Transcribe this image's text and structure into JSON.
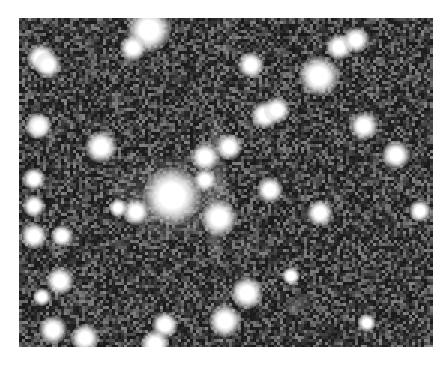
{
  "image": {
    "type": "astronomical-field",
    "background_color": "#2a2a2a",
    "frame": {
      "x": 19,
      "y": 18,
      "width": 414,
      "height": 329
    },
    "diffuse": [
      {
        "x": 155,
        "y": 180,
        "rx": 60,
        "ry": 40,
        "alpha": 0.28
      },
      {
        "x": 197,
        "y": 120,
        "rx": 8,
        "ry": 20,
        "alpha": 0.35
      },
      {
        "x": 199,
        "y": 160,
        "rx": 9,
        "ry": 30,
        "alpha": 0.35
      },
      {
        "x": 196,
        "y": 215,
        "rx": 9,
        "ry": 35,
        "alpha": 0.35
      },
      {
        "x": 205,
        "y": 300,
        "rx": 10,
        "ry": 25,
        "alpha": 0.25
      }
    ],
    "stars": [
      {
        "x": 130,
        "y": 12,
        "r": 12
      },
      {
        "x": 114,
        "y": 30,
        "r": 7
      },
      {
        "x": 22,
        "y": 40,
        "r": 8
      },
      {
        "x": 29,
        "y": 47,
        "r": 7
      },
      {
        "x": 232,
        "y": 47,
        "r": 7
      },
      {
        "x": 300,
        "y": 58,
        "r": 11
      },
      {
        "x": 320,
        "y": 29,
        "r": 7
      },
      {
        "x": 337,
        "y": 22,
        "r": 7
      },
      {
        "x": 246,
        "y": 97,
        "r": 8
      },
      {
        "x": 258,
        "y": 92,
        "r": 7
      },
      {
        "x": 19,
        "y": 108,
        "r": 7
      },
      {
        "x": 20,
        "y": 108,
        "r": 6
      },
      {
        "x": 82,
        "y": 129,
        "r": 9
      },
      {
        "x": 345,
        "y": 108,
        "r": 8
      },
      {
        "x": 377,
        "y": 137,
        "r": 8
      },
      {
        "x": 186,
        "y": 139,
        "r": 8
      },
      {
        "x": 210,
        "y": 129,
        "r": 7
      },
      {
        "x": 186,
        "y": 162,
        "r": 6
      },
      {
        "x": 153,
        "y": 178,
        "r": 16
      },
      {
        "x": 117,
        "y": 194,
        "r": 7
      },
      {
        "x": 99,
        "y": 190,
        "r": 5
      },
      {
        "x": 200,
        "y": 200,
        "r": 10
      },
      {
        "x": 251,
        "y": 172,
        "r": 7
      },
      {
        "x": 301,
        "y": 195,
        "r": 7
      },
      {
        "x": 401,
        "y": 193,
        "r": 6
      },
      {
        "x": 15,
        "y": 161,
        "r": 6
      },
      {
        "x": 15,
        "y": 188,
        "r": 6
      },
      {
        "x": 15,
        "y": 218,
        "r": 7
      },
      {
        "x": 43,
        "y": 218,
        "r": 6
      },
      {
        "x": 41,
        "y": 263,
        "r": 8
      },
      {
        "x": 23,
        "y": 279,
        "r": 5
      },
      {
        "x": 228,
        "y": 275,
        "r": 9
      },
      {
        "x": 206,
        "y": 303,
        "r": 9
      },
      {
        "x": 146,
        "y": 307,
        "r": 7
      },
      {
        "x": 34,
        "y": 312,
        "r": 8
      },
      {
        "x": 66,
        "y": 320,
        "r": 8
      },
      {
        "x": 136,
        "y": 326,
        "r": 8
      },
      {
        "x": 272,
        "y": 258,
        "r": 5
      },
      {
        "x": 348,
        "y": 305,
        "r": 5
      }
    ]
  }
}
